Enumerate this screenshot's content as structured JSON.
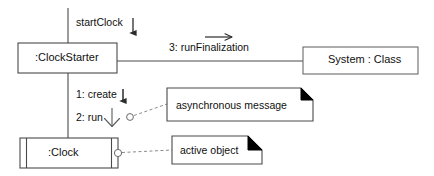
{
  "diagram": {
    "type": "uml-collaboration-diagram",
    "background_color": "#ffffff",
    "line_color": "#3a3a3a",
    "text_color": "#101010",
    "note_dogear_color": "#000000"
  },
  "objects": [
    {
      "id": "clock-starter",
      "label": ":ClockStarter",
      "kind": "object",
      "active": false
    },
    {
      "id": "system-class",
      "label": "System : Class",
      "kind": "class",
      "active": false
    },
    {
      "id": "clock",
      "label": ":Clock",
      "kind": "object",
      "active": true
    }
  ],
  "messages": [
    {
      "id": "start-clock",
      "label": "startClock",
      "direction": "down",
      "arrowhead": "filled",
      "from": "actor-entry",
      "to": "clock-starter"
    },
    {
      "id": "run-finalization",
      "label": "3: runFinalization",
      "direction": "right",
      "arrowhead": "open",
      "from": "clock-starter",
      "to": "system-class"
    },
    {
      "id": "create",
      "label": "1: create",
      "direction": "down",
      "arrowhead": "filled",
      "from": "clock-starter",
      "to": "clock"
    },
    {
      "id": "run",
      "label": "2: run",
      "direction": "down",
      "arrowhead": "half-stick",
      "from": "clock-starter",
      "to": "clock"
    }
  ],
  "notes": [
    {
      "id": "asynchronous-message-note",
      "label": "asynchronous message",
      "anchor": "run-message"
    },
    {
      "id": "active-object-note",
      "label": "active object",
      "anchor": "clock-object"
    }
  ]
}
